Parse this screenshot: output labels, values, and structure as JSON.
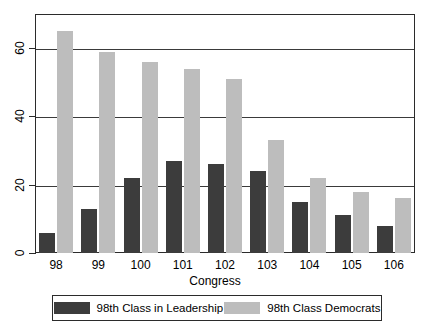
{
  "chart_data": {
    "type": "bar",
    "title": "",
    "xlabel": "Congress",
    "ylabel": "",
    "categories": [
      "98",
      "99",
      "100",
      "101",
      "102",
      "103",
      "104",
      "105",
      "106"
    ],
    "series": [
      {
        "name": "98th Class in Leadership",
        "color": "#3c3c3c",
        "values": [
          6,
          13,
          22,
          27,
          26,
          24,
          15,
          11,
          8
        ]
      },
      {
        "name": "98th Class Democrats",
        "color": "#bdbdbd",
        "values": [
          65,
          59,
          56,
          54,
          51,
          33,
          22,
          18,
          16
        ]
      }
    ],
    "ylim": [
      0,
      70
    ],
    "yticks": [
      0,
      20,
      40,
      60
    ],
    "ytick_labels": [
      "0",
      "20",
      "40",
      "60"
    ],
    "grid": true,
    "legend_position": "bottom"
  },
  "axis": {
    "x_title": "Congress"
  },
  "legend": {
    "items": [
      {
        "label": "98th Class in Leadership",
        "swatch": "dark-swatch-icon"
      },
      {
        "label": "98th Class Democrats",
        "swatch": "light-swatch-icon"
      }
    ]
  }
}
